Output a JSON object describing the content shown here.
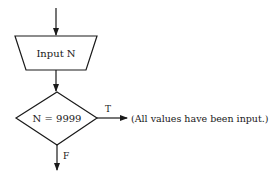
{
  "flowchart": {
    "input_box": {
      "label": "Input N",
      "shape": "trapezoid"
    },
    "decision": {
      "label": "N = 9999",
      "shape": "diamond"
    },
    "true_branch": {
      "label": "T",
      "target_text": "(All values have been input.)"
    },
    "false_branch": {
      "label": "F"
    },
    "colors": {
      "line": "#1a1a1a",
      "background": "#ffffff"
    }
  }
}
